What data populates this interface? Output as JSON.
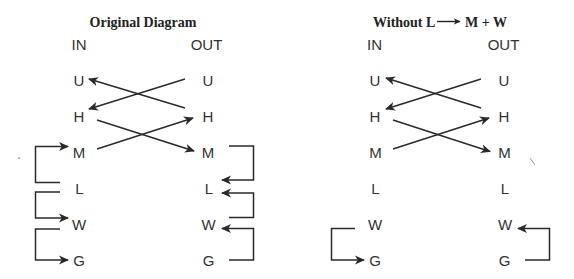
{
  "panels": [
    {
      "title": "Original Diagram",
      "in_header": "IN",
      "out_header": "OUT",
      "in_nodes": [
        "U",
        "H",
        "M",
        "L",
        "W",
        "G"
      ],
      "out_nodes": [
        "U",
        "H",
        "M",
        "L",
        "W",
        "G"
      ],
      "cross_arrows": [
        {
          "from": "OUT.H",
          "to": "IN.U"
        },
        {
          "from": "OUT.U",
          "to": "IN.H"
        },
        {
          "from": "IN.H",
          "to": "OUT.M"
        },
        {
          "from": "IN.M",
          "to": "OUT.H"
        }
      ],
      "side_arrows": [
        {
          "side": "IN",
          "from": "L",
          "to": "M"
        },
        {
          "side": "IN",
          "from": "L",
          "to": "W"
        },
        {
          "side": "IN",
          "from": "W",
          "to": "G"
        },
        {
          "side": "OUT",
          "from": "M",
          "to": "L"
        },
        {
          "side": "OUT",
          "from": "W",
          "to": "L"
        },
        {
          "side": "OUT",
          "from": "G",
          "to": "W"
        }
      ]
    },
    {
      "title": "Without L → M + W",
      "title_parts": {
        "before": "Without L",
        "arrow_icon": "long-right-arrow",
        "after": "M + W"
      },
      "in_header": "IN",
      "out_header": "OUT",
      "in_nodes": [
        "U",
        "H",
        "M",
        "L",
        "W",
        "G"
      ],
      "out_nodes": [
        "U",
        "H",
        "M",
        "L",
        "W",
        "G"
      ],
      "cross_arrows": [
        {
          "from": "OUT.H",
          "to": "IN.U"
        },
        {
          "from": "OUT.U",
          "to": "IN.H"
        },
        {
          "from": "IN.H",
          "to": "OUT.M"
        },
        {
          "from": "IN.M",
          "to": "OUT.H"
        }
      ],
      "side_arrows": [
        {
          "side": "IN",
          "from": "W",
          "to": "G"
        },
        {
          "side": "OUT",
          "from": "G",
          "to": "W"
        }
      ]
    }
  ],
  "colors": {
    "background": "#ffffff",
    "line": "#2a2a2a",
    "text": "#333333",
    "title": "#222222"
  }
}
